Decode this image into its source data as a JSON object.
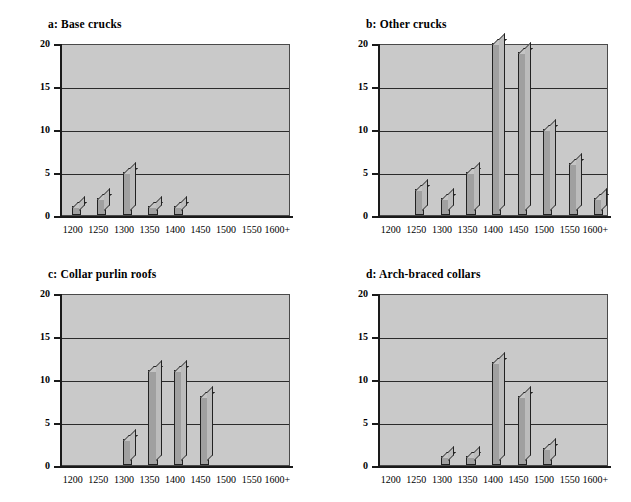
{
  "figure": {
    "background": "#ffffff",
    "plot_background": "#c9c9c9",
    "bar_color": "#a0a0a0",
    "axis_color": "#1a1a1a",
    "grid_color": "#2b2b2b"
  },
  "chart_data": [
    {
      "type": "bar",
      "title": "a: Base crucks",
      "panel": "a",
      "categories": [
        "1200",
        "1250",
        "1300",
        "1350",
        "1400",
        "1450",
        "1500",
        "1550",
        "1600+"
      ],
      "values": [
        1,
        2,
        5,
        1,
        1,
        0,
        0,
        0,
        0
      ],
      "xlabel": "",
      "ylabel": "",
      "ylim": [
        0,
        20
      ],
      "yticks": [
        0,
        5,
        10,
        15,
        20
      ],
      "grid": true,
      "legend": "none"
    },
    {
      "type": "bar",
      "title": "b: Other crucks",
      "panel": "b",
      "categories": [
        "1200",
        "1250",
        "1300",
        "1350",
        "1400",
        "1450",
        "1500",
        "1550",
        "1600+"
      ],
      "values": [
        0,
        3,
        2,
        5,
        20,
        19,
        10,
        6,
        2
      ],
      "xlabel": "",
      "ylabel": "",
      "ylim": [
        0,
        20
      ],
      "yticks": [
        0,
        5,
        10,
        15,
        20
      ],
      "grid": true,
      "legend": "none"
    },
    {
      "type": "bar",
      "title": "c: Collar purlin roofs",
      "panel": "c",
      "categories": [
        "1200",
        "1250",
        "1300",
        "1350",
        "1400",
        "1450",
        "1500",
        "1550",
        "1600+"
      ],
      "values": [
        0,
        0,
        3,
        11,
        11,
        8,
        0,
        0,
        0
      ],
      "xlabel": "",
      "ylabel": "",
      "ylim": [
        0,
        20
      ],
      "yticks": [
        0,
        5,
        10,
        15,
        20
      ],
      "grid": true,
      "legend": "none"
    },
    {
      "type": "bar",
      "title": "d: Arch-braced collars",
      "panel": "d",
      "categories": [
        "1200",
        "1250",
        "1300",
        "1350",
        "1400",
        "1450",
        "1500",
        "1550",
        "1600+"
      ],
      "values": [
        0,
        0,
        1,
        1,
        12,
        8,
        2,
        0,
        0
      ],
      "xlabel": "",
      "ylabel": "",
      "ylim": [
        0,
        20
      ],
      "yticks": [
        0,
        5,
        10,
        15,
        20
      ],
      "grid": true,
      "legend": "none"
    }
  ]
}
